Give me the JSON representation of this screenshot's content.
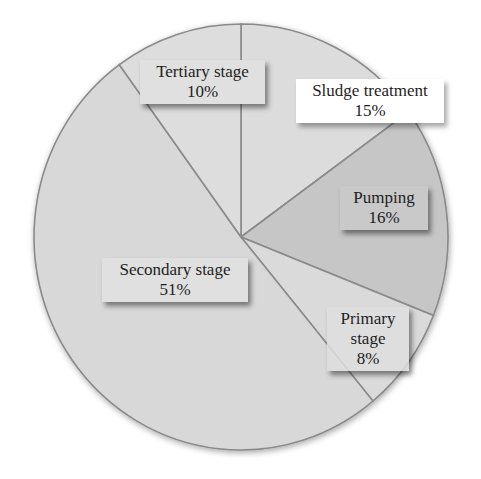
{
  "chart_data": {
    "type": "pie",
    "title": "",
    "start_angle_deg": 0,
    "direction": "clockwise",
    "slices": [
      {
        "name": "Sludge treatment",
        "value": 15,
        "label": "15%",
        "color": "#dcdcdc"
      },
      {
        "name": "Pumping",
        "value": 16,
        "label": "16%",
        "color": "#c6c6c6"
      },
      {
        "name": "Primary stage",
        "value": 8,
        "label": "8%",
        "color": "#dadada"
      },
      {
        "name": "Secondary stage",
        "value": 51,
        "label": "51%",
        "color": "#d8d8d8"
      },
      {
        "name": "Tertiary stage",
        "value": 10,
        "label": "10%",
        "color": "#dddddd"
      }
    ],
    "legend": "none (data labels on slices)",
    "grid": false
  },
  "labels": {
    "tertiary": {
      "name": "Tertiary stage",
      "pct": "10%"
    },
    "sludge": {
      "name": "Sludge treatment",
      "pct": "15%"
    },
    "pumping": {
      "name": "Pumping",
      "pct": "16%"
    },
    "secondary": {
      "name": "Secondary stage",
      "pct": "51%"
    },
    "primary": {
      "name1": "Primary",
      "name2": "stage",
      "pct": "8%"
    }
  },
  "colors": {
    "edge": "#8a8a8a",
    "background": "#ffffff"
  }
}
